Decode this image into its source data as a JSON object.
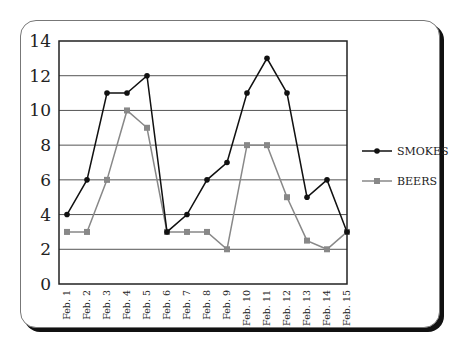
{
  "chart_data": {
    "type": "line",
    "title": "",
    "xlabel": "",
    "ylabel": "",
    "categories": [
      "Feb. 1",
      "Feb. 2",
      "Feb. 3",
      "Feb. 4",
      "Feb. 5",
      "Feb. 6",
      "Feb. 7",
      "Feb. 8",
      "Feb. 9",
      "Feb. 10",
      "Feb. 11",
      "Feb. 12",
      "Feb. 13",
      "Feb. 14",
      "Feb. 15"
    ],
    "ylim": [
      0,
      14
    ],
    "yticks": [
      0,
      2,
      4,
      6,
      8,
      10,
      12,
      14
    ],
    "grid": true,
    "legend_position": "right",
    "series": [
      {
        "name": "SMOKES",
        "color": "#111111",
        "marker": "circle",
        "values": [
          4,
          6,
          11,
          11,
          12,
          3,
          4,
          6,
          7,
          11,
          13,
          11,
          5,
          6,
          3
        ]
      },
      {
        "name": "BEERS",
        "color": "#888888",
        "marker": "square",
        "values": [
          3,
          3,
          6,
          10,
          9,
          3,
          3,
          3,
          2,
          8,
          8,
          5,
          2.5,
          2,
          3
        ]
      }
    ]
  }
}
